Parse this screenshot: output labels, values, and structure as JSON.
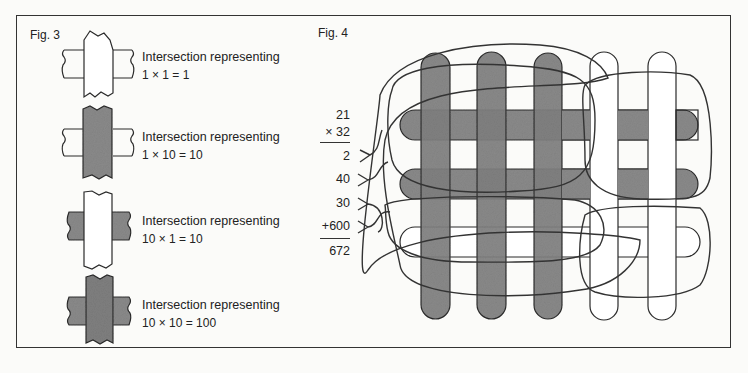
{
  "fig3": {
    "label": "Fig. 3",
    "items": [
      {
        "caption": "Intersection representing",
        "equation": "1 × 1 = 1",
        "vertical": "white",
        "horizontal": "white"
      },
      {
        "caption": "Intersection representing",
        "equation": "1 × 10 = 10",
        "vertical": "shaded",
        "horizontal": "white"
      },
      {
        "caption": "Intersection representing",
        "equation": "10 × 1 = 10",
        "vertical": "white",
        "horizontal": "shaded"
      },
      {
        "caption": "Intersection representing",
        "equation": "10 × 10 = 100",
        "vertical": "shaded",
        "horizontal": "shaded"
      }
    ]
  },
  "fig4": {
    "label": "Fig. 4",
    "multiplication": {
      "multiplicand": "21",
      "multiplier": "× 32",
      "partials": [
        "2",
        "40",
        "30",
        "+600"
      ],
      "result": "672"
    },
    "vertical_bars": {
      "shaded": 3,
      "white": 2
    },
    "horizontal_bars": {
      "shaded": 2,
      "white": 1
    }
  },
  "colors": {
    "shade": "#8a8a8a",
    "line": "#2a2a2a",
    "background": "#fbfbf9"
  }
}
